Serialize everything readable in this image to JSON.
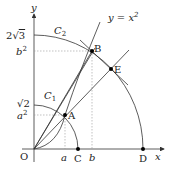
{
  "diagram": {
    "axes": {
      "x_label": "x",
      "y_label": "y",
      "origin_label": "O"
    },
    "curve_label": "y = x",
    "curve_exponent": "2",
    "circles": [
      {
        "name": "C",
        "sub": "1"
      },
      {
        "name": "C",
        "sub": "2"
      }
    ],
    "y_ticks": [
      {
        "pre": "2",
        "root": "3"
      },
      {
        "base": "b",
        "exp": "2"
      },
      {
        "root": "2"
      },
      {
        "base": "a",
        "exp": "2"
      }
    ],
    "x_ticks": [
      "a",
      "b"
    ],
    "points": {
      "A": "A",
      "B": "B",
      "C": "C",
      "D": "D",
      "E": "E"
    },
    "colors": {
      "stroke": "#333333",
      "dotted": "#999999",
      "point": "#000000"
    }
  }
}
